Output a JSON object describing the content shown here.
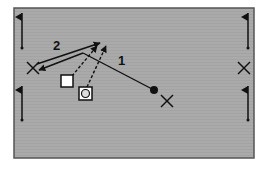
{
  "diagram": {
    "type": "soccer-drill",
    "field": {
      "x": 14,
      "y": 8,
      "width": 240,
      "height": 150,
      "fill": "#aaaaaa",
      "stroke": "#555555"
    },
    "labels": [
      {
        "id": "pass-1",
        "text": "1",
        "x": 118,
        "y": 65
      },
      {
        "id": "pass-2",
        "text": "2",
        "x": 53,
        "y": 50
      }
    ],
    "flags": [
      {
        "id": "top-left",
        "x": 22,
        "y": 13
      },
      {
        "id": "bottom-left",
        "x": 22,
        "y": 86
      },
      {
        "id": "top-right",
        "x": 248,
        "y": 13
      },
      {
        "id": "bottom-right",
        "x": 248,
        "y": 86
      }
    ],
    "cones": [
      {
        "id": "left",
        "x": 33,
        "y": 68
      },
      {
        "id": "right",
        "x": 244,
        "y": 68
      },
      {
        "id": "center",
        "x": 167,
        "y": 101
      }
    ],
    "ball": {
      "x": 154,
      "y": 90
    },
    "players": [
      {
        "id": "square",
        "shape": "square",
        "x": 67,
        "y": 81
      },
      {
        "id": "circle",
        "shape": "circle-square",
        "x": 85,
        "y": 93
      }
    ],
    "colors": {
      "line": "#111111",
      "field": "#aaaaaa",
      "border": "#555555",
      "player_fill": "#ffffff"
    }
  }
}
